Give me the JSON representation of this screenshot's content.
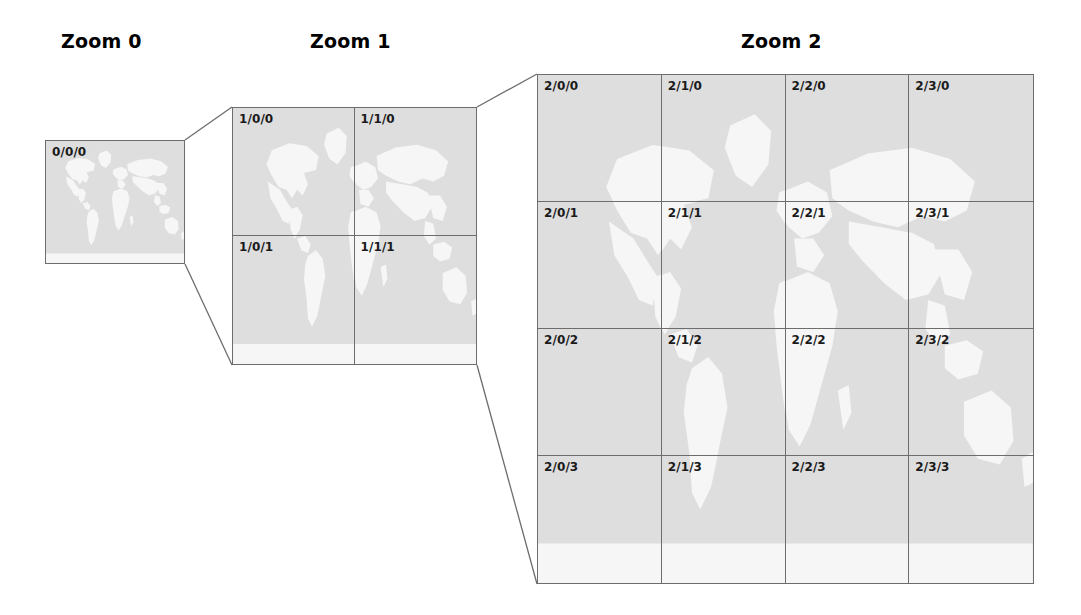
{
  "figure": {
    "kind": "tile-pyramid-diagram",
    "background_color": "#ffffff",
    "border_color": "#6d6d6d",
    "ocean_color": "#dededf",
    "land_color": "#f6f6f6",
    "label_color": "#1a1a1a"
  },
  "titles": [
    {
      "id": "zoom-0",
      "text": "Zoom 0",
      "x": 61,
      "y": 30
    },
    {
      "id": "zoom-1",
      "text": "Zoom 1",
      "x": 310,
      "y": 30
    },
    {
      "id": "zoom-2",
      "text": "Zoom 2",
      "x": 741,
      "y": 30
    }
  ],
  "levels": [
    {
      "id": "level-0",
      "zoom": 0,
      "cols": 1,
      "rows": 1,
      "x": 45,
      "y": 140,
      "width": 140,
      "height": 124,
      "tiles": [
        {
          "label": "0/0/0",
          "col": 0,
          "row": 0
        }
      ]
    },
    {
      "id": "level-1",
      "zoom": 1,
      "cols": 2,
      "rows": 2,
      "x": 232,
      "y": 107,
      "width": 245,
      "height": 258,
      "tiles": [
        {
          "label": "1/0/0",
          "col": 0,
          "row": 0
        },
        {
          "label": "1/1/0",
          "col": 1,
          "row": 0
        },
        {
          "label": "1/0/1",
          "col": 0,
          "row": 1
        },
        {
          "label": "1/1/1",
          "col": 1,
          "row": 1
        }
      ]
    },
    {
      "id": "level-2",
      "zoom": 2,
      "cols": 4,
      "rows": 4,
      "x": 537,
      "y": 74,
      "width": 497,
      "height": 510,
      "tiles": [
        {
          "label": "2/0/0",
          "col": 0,
          "row": 0
        },
        {
          "label": "2/1/0",
          "col": 1,
          "row": 0
        },
        {
          "label": "2/2/0",
          "col": 2,
          "row": 0
        },
        {
          "label": "2/3/0",
          "col": 3,
          "row": 0
        },
        {
          "label": "2/0/1",
          "col": 0,
          "row": 1
        },
        {
          "label": "2/1/1",
          "col": 1,
          "row": 1
        },
        {
          "label": "2/2/1",
          "col": 2,
          "row": 1
        },
        {
          "label": "2/3/1",
          "col": 3,
          "row": 1
        },
        {
          "label": "2/0/2",
          "col": 0,
          "row": 2
        },
        {
          "label": "2/1/2",
          "col": 1,
          "row": 2
        },
        {
          "label": "2/2/2",
          "col": 2,
          "row": 2
        },
        {
          "label": "2/3/2",
          "col": 3,
          "row": 2
        },
        {
          "label": "2/0/3",
          "col": 0,
          "row": 3
        },
        {
          "label": "2/1/3",
          "col": 1,
          "row": 3
        },
        {
          "label": "2/2/3",
          "col": 2,
          "row": 3
        },
        {
          "label": "2/3/3",
          "col": 3,
          "row": 3
        }
      ]
    }
  ],
  "connectors": [
    {
      "id": "lvl0-to-lvl1-top",
      "x1": 185,
      "y1": 140,
      "x2": 232,
      "y2": 107
    },
    {
      "id": "lvl0-to-lvl1-bottom",
      "x1": 185,
      "y1": 264,
      "x2": 232,
      "y2": 365
    },
    {
      "id": "lvl1-to-lvl2-top",
      "x1": 477,
      "y1": 107,
      "x2": 537,
      "y2": 74
    },
    {
      "id": "lvl1-to-lvl2-bottom",
      "x1": 477,
      "y1": 365,
      "x2": 537,
      "y2": 584
    }
  ]
}
